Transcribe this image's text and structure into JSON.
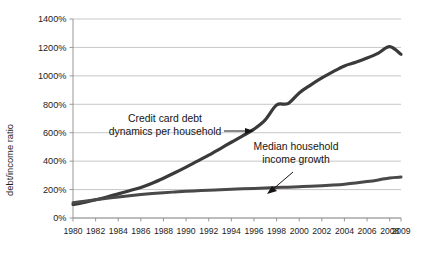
{
  "chart_data": {
    "type": "line",
    "title": "",
    "xlabel": "",
    "ylabel": "debt/income ratio",
    "ylim": [
      0,
      1400
    ],
    "xlim": [
      1980,
      2009
    ],
    "grid": true,
    "legend_position": "none",
    "y_unit": "%",
    "y_ticks": [
      0,
      200,
      400,
      600,
      800,
      1000,
      1200,
      1400
    ],
    "y_tick_labels": [
      "0%",
      "200%",
      "400%",
      "600%",
      "800%",
      "1000%",
      "1200%",
      "1400%"
    ],
    "x_ticks": [
      1980,
      1982,
      1984,
      1986,
      1988,
      1990,
      1992,
      1994,
      1996,
      1998,
      2000,
      2002,
      2004,
      2006,
      2008,
      2009
    ],
    "x_tick_labels": [
      "1980",
      "1982",
      "1984",
      "1986",
      "1988",
      "1990",
      "1992",
      "1994",
      "1996",
      "1998",
      "2000",
      "2002",
      "2004",
      "2006",
      "2008",
      "2009"
    ],
    "x": [
      1980,
      1981,
      1982,
      1983,
      1984,
      1985,
      1986,
      1987,
      1988,
      1989,
      1990,
      1991,
      1992,
      1993,
      1994,
      1995,
      1996,
      1997,
      1998,
      1999,
      2000,
      2001,
      2002,
      2003,
      2004,
      2005,
      2006,
      2007,
      2008,
      2009
    ],
    "series": [
      {
        "name": "Credit card debt dynamics per household",
        "color": "#3b3a3a",
        "width": 3.2,
        "values": [
          95,
          110,
          128,
          148,
          170,
          192,
          215,
          245,
          280,
          318,
          358,
          400,
          442,
          487,
          533,
          578,
          625,
          690,
          795,
          805,
          880,
          935,
          985,
          1030,
          1070,
          1095,
          1125,
          1160,
          1205,
          1152
        ]
      },
      {
        "name": "Median household income growth",
        "color": "#4a4848",
        "width": 3.0,
        "values": [
          108,
          118,
          128,
          138,
          148,
          157,
          165,
          172,
          178,
          183,
          188,
          192,
          196,
          199,
          202,
          205,
          208,
          211,
          214,
          217,
          220,
          223,
          227,
          232,
          238,
          246,
          256,
          268,
          282,
          288
        ]
      }
    ],
    "annotations": [
      {
        "id": "credit-card-debt-annotation",
        "lines": [
          "Credit card debt",
          "dynamics per household"
        ],
        "arrow": "right"
      },
      {
        "id": "median-income-annotation",
        "lines": [
          "Median household",
          "income growth"
        ],
        "arrow": "down-left"
      }
    ]
  }
}
